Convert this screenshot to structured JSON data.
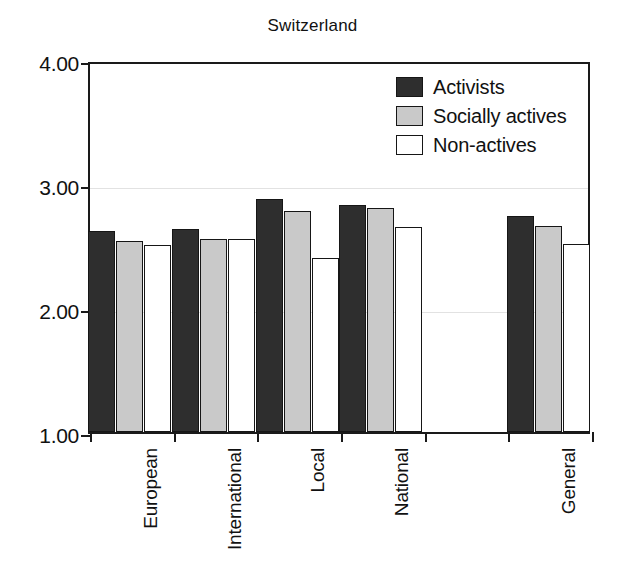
{
  "chart_data": {
    "type": "bar",
    "title": "Switzerland",
    "xlabel": "",
    "ylabel": "",
    "ylim": [
      1.0,
      4.0
    ],
    "yticks": [
      "1.00",
      "2.00",
      "3.00",
      "4.00"
    ],
    "ytick_values": [
      1.0,
      2.0,
      3.0,
      4.0
    ],
    "grid": true,
    "legend_position": "top-right",
    "categories": [
      "European",
      "International",
      "Local",
      "National",
      "",
      "General"
    ],
    "series": [
      {
        "name": "Activists",
        "color": "#2e2e2e",
        "values": [
          2.62,
          2.64,
          2.88,
          2.83,
          null,
          2.74
        ]
      },
      {
        "name": "Socially actives",
        "color": "#c9c9c9",
        "values": [
          2.54,
          2.56,
          2.78,
          2.81,
          null,
          2.66
        ]
      },
      {
        "name": "Non-actives",
        "color": "#ffffff",
        "values": [
          2.51,
          2.56,
          2.4,
          2.65,
          null,
          2.52
        ]
      }
    ]
  },
  "legend": {
    "items": [
      {
        "label": "Activists"
      },
      {
        "label": "Socially actives"
      },
      {
        "label": "Non-actives"
      }
    ]
  }
}
